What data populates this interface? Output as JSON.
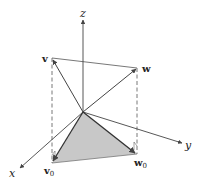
{
  "diagram": {
    "type": "3d-vector-projection",
    "origin": [
      83,
      112
    ],
    "axes": {
      "z": {
        "label": "z",
        "end": [
          83,
          20
        ],
        "label_pos": [
          80,
          15
        ]
      },
      "y": {
        "label": "y",
        "end": [
          182,
          143
        ],
        "label_pos": [
          186,
          148
        ]
      },
      "x": {
        "label": "x",
        "end": [
          20,
          168
        ],
        "label_pos": [
          9,
          176
        ]
      }
    },
    "vectors": {
      "v": {
        "label": "v",
        "tip": [
          52,
          58
        ],
        "label_pos": [
          42,
          62
        ]
      },
      "w": {
        "label": "w",
        "tip": [
          137,
          68
        ],
        "label_pos": [
          142,
          72
        ]
      },
      "v0": {
        "label": "v",
        "subscript": "0",
        "tip": [
          52,
          163
        ],
        "label_pos": [
          46,
          175
        ]
      },
      "w0": {
        "label": "w",
        "subscript": "0",
        "tip": [
          137,
          154
        ],
        "label_pos": [
          135,
          166
        ]
      }
    },
    "colors": {
      "line": "#555555",
      "fill": "#c8c8c8",
      "text": "#222222"
    }
  }
}
